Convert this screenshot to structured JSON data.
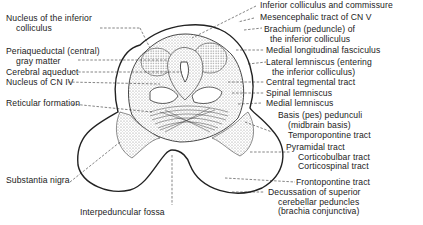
{
  "figure": {
    "left_labels": [
      {
        "id": "nuc-inf-coll",
        "lines": [
          "Nucleus of the inferior",
          "colliculus"
        ]
      },
      {
        "id": "periaqueductal",
        "lines": [
          "Periaqueductal (central)",
          "gray matter"
        ]
      },
      {
        "id": "cerebral-aqueduct",
        "lines": [
          "Cerebral aqueduct"
        ]
      },
      {
        "id": "nucleus-cn-iv",
        "lines": [
          "Nucleus of CN IV"
        ]
      },
      {
        "id": "reticular-formation",
        "lines": [
          "Reticular formation"
        ]
      },
      {
        "id": "substantia-nigra",
        "lines": [
          "Substantia nigra"
        ]
      }
    ],
    "bottom_labels": [
      {
        "id": "interpeduncular-fossa",
        "lines": [
          "Interpeduncular fossa"
        ]
      }
    ],
    "right_labels": [
      {
        "id": "inf-coll-commissure",
        "lines": [
          "Inferior colliculus and commissure"
        ]
      },
      {
        "id": "mesencephalic-tract",
        "lines": [
          "Mesencephalic tract of CN V"
        ]
      },
      {
        "id": "brachium-inf-coll",
        "lines": [
          "Brachium (peduncle) of",
          "the inferior colliculus"
        ]
      },
      {
        "id": "mlf",
        "lines": [
          "Medial longitudinal fasciculus"
        ]
      },
      {
        "id": "lateral-lemniscus",
        "lines": [
          "Lateral lemniscus (entering",
          "the inferior colliculus)"
        ]
      },
      {
        "id": "central-tegmental",
        "lines": [
          "Central tegmental tract"
        ]
      },
      {
        "id": "spinal-lemniscus",
        "lines": [
          "Spinal lemniscus"
        ]
      },
      {
        "id": "medial-lemniscus",
        "lines": [
          "Medial lemniscus"
        ]
      },
      {
        "id": "basis-pedunculi",
        "lines": [
          "Basis (pes) pedunculi",
          "(midbrain basis)"
        ]
      },
      {
        "id": "temporopontine",
        "lines": [
          "Temporopontine tract"
        ]
      },
      {
        "id": "pyramidal",
        "lines": [
          "Pyramidal tract",
          "Corticobulbar tract",
          "Corticospinal tract"
        ]
      },
      {
        "id": "frontopontine",
        "lines": [
          "Frontopontine tract"
        ]
      },
      {
        "id": "decussation-scp",
        "lines": [
          "Decussation of superior",
          "cerebellar peduncles",
          "(brachia conjunctiva)"
        ]
      }
    ]
  },
  "colors": {
    "line": "#222222",
    "stipple": "#bdbdbd",
    "background": "#ffffff"
  }
}
